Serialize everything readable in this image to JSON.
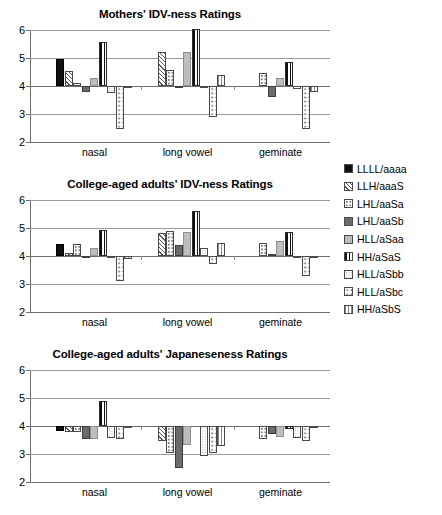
{
  "chart_data": [
    {
      "type": "bar",
      "title": "Mothers' IDV-ness Ratings",
      "xlabel": "",
      "ylabel": "",
      "ylim": [
        2,
        6
      ],
      "yticks": [
        2,
        3,
        4,
        5,
        6
      ],
      "baseline": 4,
      "grid": true,
      "legend_position": "right",
      "categories": [
        "nasal",
        "long vowel",
        "geminate"
      ],
      "series": [
        {
          "name": "LLLL/aaaa",
          "values": [
            4.95,
            null,
            null
          ]
        },
        {
          "name": "LLH/aaaS",
          "values": [
            4.55,
            5.22,
            null
          ]
        },
        {
          "name": "LHL/aaSa",
          "values": [
            4.12,
            4.58,
            4.47
          ]
        },
        {
          "name": "LHL/aaSb",
          "values": [
            3.8,
            3.94,
            3.62
          ]
        },
        {
          "name": "HLL/aSaa",
          "values": [
            4.27,
            5.2,
            4.27
          ]
        },
        {
          "name": "HH/aSaS",
          "values": [
            5.56,
            6.02,
            4.86
          ]
        },
        {
          "name": "HLL/aSbb",
          "values": [
            3.76,
            3.93,
            3.88
          ]
        },
        {
          "name": "HLL/aSbc",
          "values": [
            2.46,
            2.9,
            2.47
          ]
        },
        {
          "name": "HH/aSbS",
          "values": [
            3.96,
            4.38,
            3.8
          ]
        }
      ]
    },
    {
      "type": "bar",
      "title": "College-aged adults' IDV-ness Ratings",
      "xlabel": "",
      "ylabel": "",
      "ylim": [
        2,
        6
      ],
      "yticks": [
        2,
        3,
        4,
        5,
        6
      ],
      "baseline": 4,
      "grid": true,
      "legend_position": "right",
      "categories": [
        "nasal",
        "long vowel",
        "geminate"
      ],
      "series": [
        {
          "name": "LLLL/aaaa",
          "values": [
            4.43,
            null,
            null
          ]
        },
        {
          "name": "LLH/aaaS",
          "values": [
            4.1,
            4.82,
            null
          ]
        },
        {
          "name": "LHL/aaSa",
          "values": [
            4.42,
            4.9,
            4.45
          ]
        },
        {
          "name": "LHL/aaSb",
          "values": [
            3.92,
            4.38,
            4.06
          ]
        },
        {
          "name": "HLL/aSaa",
          "values": [
            4.3,
            4.86,
            4.52
          ]
        },
        {
          "name": "HH/aSaS",
          "values": [
            4.94,
            5.6,
            4.86
          ]
        },
        {
          "name": "HLL/aSbb",
          "values": [
            3.92,
            4.28,
            3.95
          ]
        },
        {
          "name": "HLL/aSbc",
          "values": [
            3.12,
            3.72,
            3.27
          ]
        },
        {
          "name": "HH/aSbS",
          "values": [
            3.88,
            4.45,
            3.97
          ]
        }
      ]
    },
    {
      "type": "bar",
      "title": "College-aged adults' Japaneseness Ratings",
      "xlabel": "",
      "ylabel": "",
      "ylim": [
        2,
        6
      ],
      "yticks": [
        2,
        3,
        4,
        5,
        6
      ],
      "baseline": 4,
      "grid": true,
      "legend_position": "right",
      "categories": [
        "nasal",
        "long vowel",
        "geminate"
      ],
      "series": [
        {
          "name": "LLLL/aaaa",
          "values": [
            3.82,
            null,
            null
          ]
        },
        {
          "name": "LLH/aaaS",
          "values": [
            3.8,
            3.45,
            null
          ]
        },
        {
          "name": "LHL/aaSa",
          "values": [
            3.78,
            3.05,
            3.52
          ]
        },
        {
          "name": "LHL/aaSb",
          "values": [
            3.55,
            2.5,
            3.7
          ]
        },
        {
          "name": "HLL/aSaa",
          "values": [
            3.55,
            3.32,
            3.62
          ]
        },
        {
          "name": "HH/aSaS",
          "values": [
            4.88,
            null,
            3.88
          ]
        },
        {
          "name": "HLL/aSbb",
          "values": [
            3.58,
            2.92,
            3.58
          ]
        },
        {
          "name": "HLL/aSbc",
          "values": [
            3.52,
            3.02,
            3.48
          ]
        },
        {
          "name": "HH/aSbS",
          "values": [
            3.97,
            3.28,
            3.95
          ]
        }
      ]
    }
  ],
  "legend": {
    "items": [
      {
        "label": "LLLL/aaaa",
        "swatch": "solid-black-swatch"
      },
      {
        "label": "LLH/aaaS",
        "swatch": "diagonal-hatch-swatch"
      },
      {
        "label": "LHL/aaSa",
        "swatch": "light-dot-swatch"
      },
      {
        "label": "LHL/aaSb",
        "swatch": "dark-gray-swatch"
      },
      {
        "label": "HLL/aSaa",
        "swatch": "light-gray-swatch"
      },
      {
        "label": "HH/aSaS",
        "swatch": "vertical-bar-swatch"
      },
      {
        "label": "HLL/aSbb",
        "swatch": "fine-dot-swatch"
      },
      {
        "label": "HLL/aSbc",
        "swatch": "coarse-dot-swatch"
      },
      {
        "label": "HH/aSbS",
        "swatch": "vertical-line-swatch"
      }
    ]
  }
}
